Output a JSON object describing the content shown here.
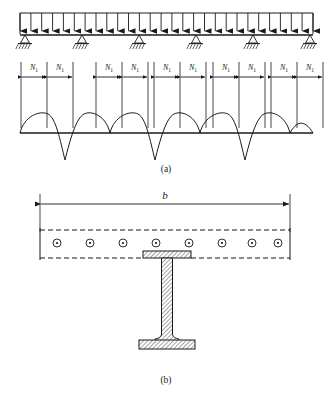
{
  "figure": {
    "title_parts": [
      "(a)",
      "(b)"
    ],
    "stroke_color": "#1a1a1a",
    "background": "#ffffff"
  },
  "panel_a": {
    "caption": "(a)",
    "beam": {
      "left_x": 20,
      "right_x": 313,
      "load_line_y": 13,
      "beam_y": 35,
      "arrow_count": 28,
      "description": "uniformly-distributed-load-on-continuous-beam"
    },
    "supports": {
      "count": 6,
      "positions_x": [
        25,
        82,
        139,
        196,
        253,
        310
      ],
      "type": "pinned-hatched-support"
    },
    "force_labels": {
      "text": "N",
      "subscript": "1",
      "pairs": 5,
      "group_centers_x": [
        46,
        121,
        180,
        238,
        296
      ],
      "label_y": 67,
      "arrow_y": 77
    },
    "moment_diagram": {
      "baseline_y": 133,
      "positive_arcs": 5,
      "negative_cusps": 4,
      "arc_height": 18,
      "cusp_depth": 27
    }
  },
  "panel_b": {
    "caption": "(b)",
    "dimension": {
      "label": "b",
      "label_y": 193,
      "line_y": 203,
      "left_x": 40,
      "right_x": 290
    },
    "slab": {
      "left_x": 40,
      "right_x": 290,
      "top_y": 228,
      "bottom_y": 258,
      "style": "dashed-outline"
    },
    "rebar": {
      "count": 8,
      "positions_x": [
        57,
        90,
        123,
        156,
        189,
        222,
        255,
        281
      ],
      "center_y": 243,
      "radius": 4,
      "style": "circle-with-dot"
    },
    "ibeam": {
      "center_x": 167,
      "top_flange_y": 258,
      "top_flange_width": 48,
      "top_flange_thickness": 7,
      "web_top_y": 265,
      "web_bottom_y": 340,
      "web_width": 11,
      "bottom_flange_y": 340,
      "bottom_flange_width": 56,
      "bottom_flange_thickness": 9,
      "fill": "diagonal-hatch"
    }
  }
}
